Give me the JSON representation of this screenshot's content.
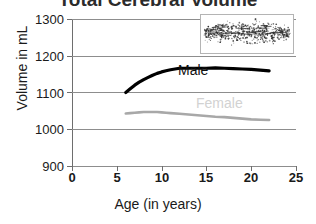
{
  "chart_data": {
    "type": "line",
    "title": "Total Cerebral Volume",
    "xlabel": "Age (in years)",
    "ylabel": "Volume in mL",
    "xlim": [
      0,
      25
    ],
    "ylim": [
      900,
      1300
    ],
    "xticks": [
      0,
      5,
      10,
      15,
      20,
      25
    ],
    "yticks": [
      900,
      1000,
      1100,
      1200,
      1300
    ],
    "grid": "horizontal",
    "legend_position": "inline-annotation",
    "series": [
      {
        "name": "Male",
        "color": "#000000",
        "label_text": "Male",
        "x": [
          6.0,
          6.5,
          7.0,
          7.5,
          8.0,
          8.5,
          9.0,
          9.5,
          10.0,
          10.5,
          11.0,
          11.5,
          12.0,
          12.5,
          13.0,
          13.5,
          14.0,
          15.0,
          16.0,
          17.0,
          18.0,
          19.0,
          20.0,
          21.0,
          22.0
        ],
        "values": [
          1100,
          1110,
          1120,
          1128,
          1135,
          1141,
          1147,
          1152,
          1156,
          1159,
          1162,
          1164,
          1166,
          1166,
          1166,
          1166,
          1166,
          1166,
          1167,
          1166,
          1165,
          1164,
          1163,
          1161,
          1159
        ]
      },
      {
        "name": "Female",
        "color": "#a8a8a8",
        "label_text": "Female",
        "x": [
          6.0,
          6.5,
          7.0,
          7.5,
          8.0,
          8.5,
          9.0,
          9.5,
          10.0,
          10.5,
          11.0,
          12.0,
          13.0,
          14.0,
          15.0,
          16.0,
          17.0,
          18.0,
          19.0,
          20.0,
          21.0,
          22.0
        ],
        "values": [
          1043,
          1044,
          1045,
          1046,
          1047,
          1047,
          1047,
          1047,
          1046,
          1045,
          1044,
          1042,
          1040,
          1038,
          1036,
          1034,
          1033,
          1031,
          1029,
          1027,
          1026,
          1025
        ]
      }
    ],
    "inset": {
      "name": "scatter-inset",
      "type": "scatter",
      "description": "dense scatter of individual subject volumes vs age",
      "point_color": "#303030",
      "border_color": "#b4b4b4"
    }
  }
}
